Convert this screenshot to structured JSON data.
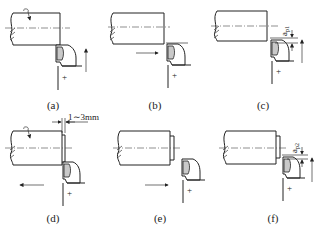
{
  "panels": [
    {
      "id": "a",
      "caption": "(a)",
      "feed": "up",
      "rotation_arrow": true
    },
    {
      "id": "b",
      "caption": "(b)",
      "feed": "right"
    },
    {
      "id": "c",
      "caption": "(c)",
      "feed": "up",
      "dimension_label": "a_p1"
    },
    {
      "id": "d",
      "caption": "(d)",
      "feed": "left",
      "rotation_arrow": true,
      "dimension_label": "1~3mm"
    },
    {
      "id": "e",
      "caption": "(e)",
      "feed": "right"
    },
    {
      "id": "f",
      "caption": "(f)",
      "feed": "up",
      "dimension_label": "a_p2"
    }
  ],
  "labels": {
    "ap1": "a",
    "ap1_sub": "p1",
    "ap2": "a",
    "ap2_sub": "p2",
    "gap": "1∼3mm",
    "plus": "+"
  },
  "captions": {
    "a": "(a)",
    "b": "(b)",
    "c": "(c)",
    "d": "(d)",
    "e": "(e)",
    "f": "(f)"
  }
}
